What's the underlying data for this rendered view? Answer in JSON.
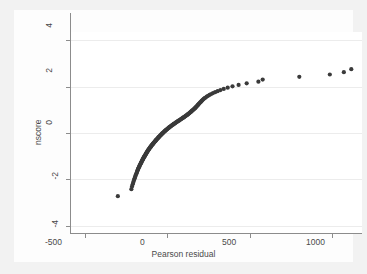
{
  "chart_data": {
    "type": "scatter",
    "title": "",
    "subtitle": "",
    "xlabel": "Pearson residual",
    "ylabel": "nscore",
    "xlim": [
      -590,
      1180
    ],
    "ylim": [
      -4.35,
      4.35
    ],
    "xticks": [
      -500,
      0,
      500,
      1000
    ],
    "xticklabels": [
      "-500",
      "0",
      "500",
      "1000"
    ],
    "yticks": [
      -4,
      -2,
      0,
      2,
      4
    ],
    "yticklabels": [
      "-4",
      "-2",
      "0",
      "2",
      "4"
    ],
    "grid": "horizontal",
    "legend": "none",
    "marker_color": "#3a3a3a",
    "marker_size": 2.1,
    "background_color": "#ffffff",
    "page_color": "#f2f2f2",
    "gridline_color": "#ececec",
    "axis_color": "#8c8c8c",
    "series": [
      {
        "name": "nscore vs Pearson residual",
        "points": [
          [
            -300,
            -2.72
          ],
          [
            -218,
            -2.42
          ],
          [
            -214,
            -2.3
          ],
          [
            -210,
            -2.21
          ],
          [
            -207,
            -2.14
          ],
          [
            -204,
            -2.07
          ],
          [
            -201,
            -2.01
          ],
          [
            -198,
            -1.95
          ],
          [
            -196,
            -1.9
          ],
          [
            -193,
            -1.85
          ],
          [
            -191,
            -1.8
          ],
          [
            -188,
            -1.76
          ],
          [
            -186,
            -1.72
          ],
          [
            -184,
            -1.68
          ],
          [
            -182,
            -1.64
          ],
          [
            -180,
            -1.6
          ],
          [
            -178,
            -1.57
          ],
          [
            -176,
            -1.53
          ],
          [
            -174,
            -1.5
          ],
          [
            -172,
            -1.47
          ],
          [
            -170,
            -1.44
          ],
          [
            -168,
            -1.41
          ],
          [
            -166,
            -1.38
          ],
          [
            -164,
            -1.35
          ],
          [
            -162,
            -1.32
          ],
          [
            -160,
            -1.3
          ],
          [
            -158,
            -1.27
          ],
          [
            -157,
            -1.25
          ],
          [
            -155,
            -1.22
          ],
          [
            -153,
            -1.2
          ],
          [
            -151,
            -1.17
          ],
          [
            -150,
            -1.15
          ],
          [
            -148,
            -1.13
          ],
          [
            -146,
            -1.1
          ],
          [
            -145,
            -1.08
          ],
          [
            -143,
            -1.06
          ],
          [
            -141,
            -1.04
          ],
          [
            -140,
            -1.02
          ],
          [
            -138,
            -1.0
          ],
          [
            -136,
            -0.98
          ],
          [
            -135,
            -0.96
          ],
          [
            -133,
            -0.94
          ],
          [
            -131,
            -0.92
          ],
          [
            -130,
            -0.9
          ],
          [
            -128,
            -0.88
          ],
          [
            -126,
            -0.86
          ],
          [
            -125,
            -0.84
          ],
          [
            -123,
            -0.82
          ],
          [
            -121,
            -0.8
          ],
          [
            -120,
            -0.78
          ],
          [
            -118,
            -0.76
          ],
          [
            -116,
            -0.75
          ],
          [
            -115,
            -0.73
          ],
          [
            -113,
            -0.71
          ],
          [
            -111,
            -0.69
          ],
          [
            -109,
            -0.67
          ],
          [
            -108,
            -0.66
          ],
          [
            -106,
            -0.64
          ],
          [
            -104,
            -0.62
          ],
          [
            -102,
            -0.6
          ],
          [
            -100,
            -0.59
          ],
          [
            -99,
            -0.57
          ],
          [
            -97,
            -0.55
          ],
          [
            -95,
            -0.53
          ],
          [
            -93,
            -0.52
          ],
          [
            -91,
            -0.5
          ],
          [
            -89,
            -0.48
          ],
          [
            -87,
            -0.47
          ],
          [
            -85,
            -0.45
          ],
          [
            -83,
            -0.43
          ],
          [
            -81,
            -0.41
          ],
          [
            -79,
            -0.4
          ],
          [
            -77,
            -0.38
          ],
          [
            -75,
            -0.36
          ],
          [
            -73,
            -0.35
          ],
          [
            -71,
            -0.33
          ],
          [
            -69,
            -0.31
          ],
          [
            -67,
            -0.29
          ],
          [
            -65,
            -0.28
          ],
          [
            -63,
            -0.26
          ],
          [
            -60,
            -0.24
          ],
          [
            -58,
            -0.23
          ],
          [
            -56,
            -0.21
          ],
          [
            -54,
            -0.19
          ],
          [
            -51,
            -0.17
          ],
          [
            -49,
            -0.16
          ],
          [
            -47,
            -0.14
          ],
          [
            -44,
            -0.12
          ],
          [
            -42,
            -0.1
          ],
          [
            -40,
            -0.09
          ],
          [
            -37,
            -0.07
          ],
          [
            -35,
            -0.05
          ],
          [
            -32,
            -0.03
          ],
          [
            -30,
            -0.02
          ],
          [
            -27,
            0.0
          ],
          [
            -25,
            0.02
          ],
          [
            -22,
            0.03
          ],
          [
            -20,
            0.05
          ],
          [
            -17,
            0.07
          ],
          [
            -14,
            0.09
          ],
          [
            -12,
            0.1
          ],
          [
            -9,
            0.12
          ],
          [
            -6,
            0.14
          ],
          [
            -3,
            0.16
          ],
          [
            0,
            0.17
          ],
          [
            3,
            0.19
          ],
          [
            6,
            0.21
          ],
          [
            9,
            0.23
          ],
          [
            12,
            0.24
          ],
          [
            15,
            0.26
          ],
          [
            18,
            0.28
          ],
          [
            21,
            0.29
          ],
          [
            24,
            0.31
          ],
          [
            28,
            0.33
          ],
          [
            31,
            0.35
          ],
          [
            34,
            0.36
          ],
          [
            38,
            0.38
          ],
          [
            41,
            0.4
          ],
          [
            45,
            0.41
          ],
          [
            48,
            0.43
          ],
          [
            52,
            0.45
          ],
          [
            55,
            0.47
          ],
          [
            59,
            0.48
          ],
          [
            62,
            0.5
          ],
          [
            66,
            0.52
          ],
          [
            70,
            0.53
          ],
          [
            73,
            0.55
          ],
          [
            77,
            0.57
          ],
          [
            81,
            0.59
          ],
          [
            84,
            0.6
          ],
          [
            88,
            0.62
          ],
          [
            92,
            0.64
          ],
          [
            95,
            0.66
          ],
          [
            99,
            0.67
          ],
          [
            103,
            0.69
          ],
          [
            106,
            0.71
          ],
          [
            110,
            0.73
          ],
          [
            113,
            0.75
          ],
          [
            117,
            0.76
          ],
          [
            120,
            0.78
          ],
          [
            124,
            0.8
          ],
          [
            127,
            0.82
          ],
          [
            131,
            0.84
          ],
          [
            134,
            0.86
          ],
          [
            137,
            0.88
          ],
          [
            141,
            0.9
          ],
          [
            144,
            0.92
          ],
          [
            147,
            0.94
          ],
          [
            150,
            0.96
          ],
          [
            153,
            0.98
          ],
          [
            157,
            1.0
          ],
          [
            160,
            1.02
          ],
          [
            163,
            1.04
          ],
          [
            166,
            1.06
          ],
          [
            169,
            1.08
          ],
          [
            172,
            1.1
          ],
          [
            175,
            1.13
          ],
          [
            178,
            1.15
          ],
          [
            181,
            1.17
          ],
          [
            184,
            1.2
          ],
          [
            187,
            1.22
          ],
          [
            190,
            1.25
          ],
          [
            193,
            1.27
          ],
          [
            197,
            1.3
          ],
          [
            200,
            1.32
          ],
          [
            204,
            1.35
          ],
          [
            208,
            1.38
          ],
          [
            212,
            1.41
          ],
          [
            216,
            1.44
          ],
          [
            221,
            1.47
          ],
          [
            226,
            1.5
          ],
          [
            232,
            1.53
          ],
          [
            239,
            1.57
          ],
          [
            247,
            1.6
          ],
          [
            256,
            1.64
          ],
          [
            266,
            1.68
          ],
          [
            277,
            1.72
          ],
          [
            290,
            1.76
          ],
          [
            305,
            1.8
          ],
          [
            322,
            1.85
          ],
          [
            342,
            1.9
          ],
          [
            366,
            1.95
          ],
          [
            395,
            2.01
          ],
          [
            432,
            2.07
          ],
          [
            481,
            2.14
          ],
          [
            552,
            2.21
          ],
          [
            578,
            2.3
          ],
          [
            800,
            2.42
          ],
          [
            985,
            2.52
          ],
          [
            1070,
            2.62
          ],
          [
            1115,
            2.75
          ]
        ]
      }
    ]
  },
  "axes": {
    "x_tick_labels": [
      "-500",
      "0",
      "500",
      "1000"
    ],
    "y_tick_labels": [
      "4",
      "2",
      "0",
      "-2",
      "-4"
    ],
    "x_title": "Pearson residual",
    "y_title": "nscore"
  }
}
